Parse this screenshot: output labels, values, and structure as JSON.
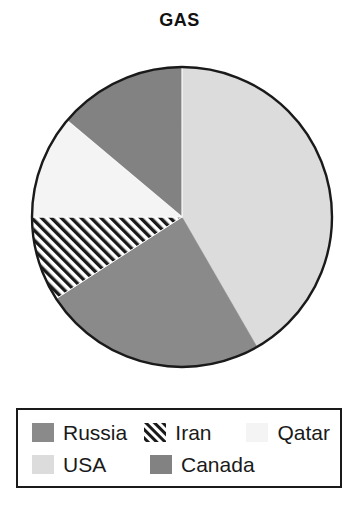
{
  "chart_data": {
    "type": "pie",
    "title": "GAS",
    "xlabel": "",
    "ylabel": "",
    "legend_position": "bottom",
    "grid": false,
    "start_angle_deg": 0,
    "direction": "clockwise",
    "categories": [
      "USA",
      "Russia",
      "Iran",
      "Qatar",
      "Canada"
    ],
    "values": [
      41.7,
      24.2,
      9.2,
      11.1,
      13.8
    ],
    "slices": [
      {
        "label": "USA",
        "value": 41.7,
        "start_deg": 0,
        "end_deg": 150,
        "color": "#d9d9d9",
        "pattern": "solid"
      },
      {
        "label": "Russia",
        "value": 24.2,
        "start_deg": 150,
        "end_deg": 237,
        "color": "#8a8a8a",
        "pattern": "solid"
      },
      {
        "label": "Iran",
        "value": 9.2,
        "start_deg": 237,
        "end_deg": 270,
        "color": "#ffffff",
        "pattern": "diagonal-hatch"
      },
      {
        "label": "Qatar",
        "value": 11.1,
        "start_deg": 270,
        "end_deg": 310,
        "color": "#f4f4f4",
        "pattern": "solid"
      },
      {
        "label": "Canada",
        "value": 13.8,
        "start_deg": 310,
        "end_deg": 360,
        "color": "#828282",
        "pattern": "solid"
      }
    ]
  },
  "legend": {
    "rows": [
      [
        {
          "label": "Russia",
          "swatch": "legend-swatch-russia"
        },
        {
          "label": "Iran",
          "swatch": "legend-swatch-iran"
        },
        {
          "label": "Qatar",
          "swatch": "legend-swatch-qatar"
        }
      ],
      [
        {
          "label": "USA",
          "swatch": "legend-swatch-usa"
        },
        {
          "label": "Canada",
          "swatch": "legend-swatch-canada"
        }
      ]
    ]
  },
  "colors": {
    "russia": "#8a8a8a",
    "iran_stripe": "#1a1a1a",
    "iran_background": "#ffffff",
    "qatar": "#f4f4f4",
    "usa": "#dcdcdc",
    "canada": "#828282",
    "outline": "#1a1a1a",
    "title_color": "#111111"
  }
}
